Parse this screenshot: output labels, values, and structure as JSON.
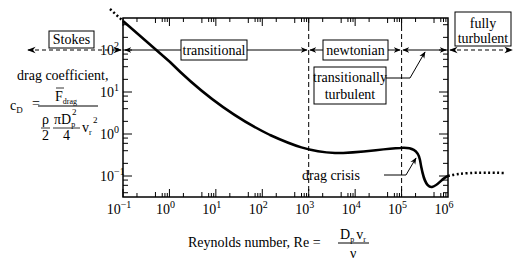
{
  "chart_data": {
    "type": "line",
    "title": "",
    "xlabel": "Reynolds number, Re = D_p v_r / ν",
    "ylabel": "drag coefficient, c_D = F_drag / ((ρ/2)(πD_p²/4) v_r²)",
    "xscale": "log",
    "yscale": "log",
    "xlim": [
      0.1,
      1000000
    ],
    "ylim": [
      0.06,
      400
    ],
    "x_ticks": [
      "10⁻¹",
      "10⁰",
      "10¹",
      "10²",
      "10³",
      "10⁴",
      "10⁵",
      "10⁶"
    ],
    "y_ticks": [
      "10⁻¹",
      "10⁰",
      "10¹",
      "10²"
    ],
    "series": [
      {
        "name": "drag coefficient curve",
        "x": [
          0.1,
          1,
          10,
          100,
          1000,
          5000,
          10000,
          100000,
          200000,
          300000,
          400000,
          1000000
        ],
        "y": [
          240,
          26,
          4.2,
          1.1,
          0.47,
          0.39,
          0.4,
          0.47,
          0.42,
          0.15,
          0.09,
          0.16
        ]
      }
    ],
    "regions": [
      {
        "name": "Stokes",
        "range": [
          "<",
          0.1
        ]
      },
      {
        "name": "transitional",
        "range": [
          0.1,
          1000
        ]
      },
      {
        "name": "newtonian",
        "range": [
          1000,
          100000
        ]
      },
      {
        "name": "transitionally turbulent",
        "range": [
          100000,
          1000000
        ]
      },
      {
        "name": "fully turbulent",
        "range": [
          1000000,
          ">"
        ]
      }
    ],
    "annotations": [
      "drag crisis"
    ],
    "grid": false
  },
  "labels": {
    "stokes": "Stokes",
    "transitional": "transitional",
    "newtonian": "newtonian",
    "trans_turb_1": "transitionally",
    "trans_turb_2": "turbulent",
    "fully_1": "fully",
    "fully_2": "turbulent",
    "drag_crisis": "drag crisis",
    "ylabel_title": "drag coefficient,",
    "cd": "c",
    "cd_sub": "D",
    "eq": "=",
    "F": "F",
    "F_sub": "drag",
    "rho": "ρ",
    "two": "2",
    "piD": "πD",
    "p_sub": "p",
    "sq": "2",
    "four": "4",
    "v": "v",
    "r_sub": "r",
    "xlabel_text": "Reynolds number,  Re =",
    "Dp": "D",
    "nu": "ν"
  },
  "ticks": {
    "x": [
      {
        "base": "10",
        "exp": "−1"
      },
      {
        "base": "10",
        "exp": "0"
      },
      {
        "base": "10",
        "exp": "1"
      },
      {
        "base": "10",
        "exp": "2"
      },
      {
        "base": "10",
        "exp": "3"
      },
      {
        "base": "10",
        "exp": "4"
      },
      {
        "base": "10",
        "exp": "5"
      },
      {
        "base": "10",
        "exp": "6"
      }
    ],
    "y": [
      {
        "base": "10",
        "exp": "2"
      },
      {
        "base": "10",
        "exp": "1"
      },
      {
        "base": "10",
        "exp": "0"
      },
      {
        "base": "10",
        "exp": "−1"
      }
    ]
  }
}
